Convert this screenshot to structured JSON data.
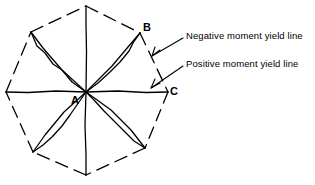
{
  "figure": {
    "type": "yield-line-pattern-diagram",
    "background_color": "#ffffff",
    "stroke_color": "#000000",
    "geometry": {
      "center": {
        "x": 86,
        "y": 92,
        "label": "A"
      },
      "octagon_vertices": [
        {
          "x": 86,
          "y": 6
        },
        {
          "x": 140,
          "y": 33
        },
        {
          "x": 168,
          "y": 92
        },
        {
          "x": 145,
          "y": 148
        },
        {
          "x": 86,
          "y": 175
        },
        {
          "x": 33,
          "y": 152
        },
        {
          "x": 6,
          "y": 92
        },
        {
          "x": 31,
          "y": 32
        }
      ],
      "perimeter_style": "dashed",
      "radial_style": "solid"
    },
    "vertex_labels": [
      {
        "id": "A",
        "text": "A",
        "x": 71,
        "y": 95
      },
      {
        "id": "B",
        "text": "B",
        "x": 143,
        "y": 22
      },
      {
        "id": "C",
        "text": "C",
        "x": 170,
        "y": 86
      }
    ],
    "callouts": [
      {
        "id": "negative",
        "text": "Negative moment yield line",
        "label_x": 186,
        "label_y": 31,
        "leader_from": {
          "x": 183,
          "y": 38
        },
        "leader_to": {
          "x": 152,
          "y": 56
        },
        "refers_to": "dashed-octagon-perimeter"
      },
      {
        "id": "positive",
        "text": "Positive moment yield line",
        "label_x": 186,
        "label_y": 59,
        "leader_from": {
          "x": 183,
          "y": 66
        },
        "leader_to": {
          "x": 151,
          "y": 88
        },
        "refers_to": "solid-radial-yield-line"
      }
    ]
  }
}
